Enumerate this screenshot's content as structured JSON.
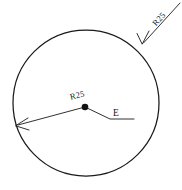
{
  "drawing": {
    "type": "engineering-circle-dimension",
    "background_color": "#ffffff",
    "line_color": "#1a1a1a",
    "width": 182,
    "height": 190,
    "labels": {
      "outer_radius_label": "R25",
      "inner_radius_label": "R25",
      "point_label": "E"
    },
    "circle": {
      "center_x": 86,
      "center_y": 103,
      "radius": 73
    },
    "center_point": {
      "x": 85,
      "y": 107,
      "dot_radius": 3.2
    },
    "inner_dimension": {
      "label": "R25",
      "from_x": 85,
      "from_y": 107,
      "to_x": 16,
      "to_y": 126,
      "label_x": 78,
      "label_y": 98,
      "label_rotation": -14
    },
    "outer_dimension": {
      "label": "R25",
      "from_x": 180,
      "from_y": 3,
      "to_x": 142,
      "to_y": 44,
      "label_x": 160,
      "label_y": 20,
      "label_rotation": -47
    },
    "point_leader": {
      "label": "E",
      "from_x": 85,
      "from_y": 107,
      "bend_x": 110,
      "bend_y": 119,
      "to_x": 134,
      "to_y": 119,
      "label_x": 115,
      "label_y": 116
    }
  }
}
